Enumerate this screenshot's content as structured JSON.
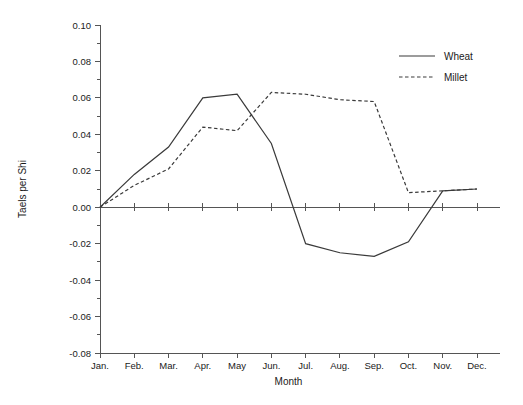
{
  "chart_data": {
    "type": "line",
    "title": "",
    "xlabel": "Month",
    "ylabel": "Taels per Shi",
    "categories": [
      "Jan.",
      "Feb.",
      "Mar.",
      "Apr.",
      "May",
      "Jun.",
      "Jul.",
      "Aug.",
      "Sep.",
      "Oct.",
      "Nov.",
      "Dec."
    ],
    "ylim": [
      -0.08,
      0.1
    ],
    "ytick_labels": [
      "0.10",
      "0.08",
      "0.06",
      "0.04",
      "0.02",
      "0.00",
      "-0.02",
      "-0.04",
      "-0.06",
      "-0.08"
    ],
    "ytick_values": [
      0.1,
      0.08,
      0.06,
      0.04,
      0.02,
      0.0,
      -0.02,
      -0.04,
      -0.06,
      -0.08
    ],
    "yminor_step": 0.01,
    "grid": false,
    "legend_position": "top-right",
    "series": [
      {
        "name": "Wheat",
        "style": "solid",
        "color": "#3a3a3a",
        "values": [
          0.0,
          0.018,
          0.033,
          0.06,
          0.062,
          0.035,
          -0.02,
          -0.025,
          -0.027,
          -0.019,
          0.009,
          0.01
        ]
      },
      {
        "name": "Millet",
        "style": "dashed",
        "color": "#3a3a3a",
        "values": [
          0.0,
          0.012,
          0.021,
          0.044,
          0.042,
          0.063,
          0.062,
          0.059,
          0.058,
          0.008,
          0.009,
          0.01
        ]
      }
    ]
  },
  "legend": {
    "items": [
      {
        "label": "Wheat"
      },
      {
        "label": "Millet"
      }
    ]
  },
  "axes": {
    "y_title": "Taels per Shi",
    "x_title": "Month"
  }
}
